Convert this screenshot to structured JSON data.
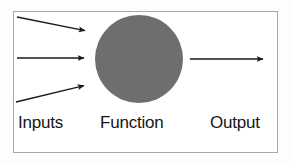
{
  "diagram": {
    "frame": {
      "border_color": "#a9a9a9",
      "background": "#ffffff"
    },
    "labels": {
      "inputs": "Inputs",
      "function": "Function",
      "output": "Output"
    },
    "node": {
      "name": "function-node",
      "shape": "circle",
      "fill_color": "#6e6e6e",
      "center_x": 139,
      "center_y": 59,
      "radius": 44
    },
    "arrows": {
      "stroke_color": "#1a1a1a",
      "input": [
        {
          "name": "input-arrow-top",
          "x1": 17,
          "y1": 17,
          "x2": 88,
          "y2": 31
        },
        {
          "name": "input-arrow-middle",
          "x1": 17,
          "y1": 58,
          "x2": 87,
          "y2": 58
        },
        {
          "name": "input-arrow-bottom",
          "x1": 16,
          "y1": 102,
          "x2": 87,
          "y2": 85
        }
      ],
      "output": [
        {
          "name": "output-arrow",
          "x1": 190,
          "y1": 59,
          "x2": 266,
          "y2": 59
        }
      ]
    }
  }
}
